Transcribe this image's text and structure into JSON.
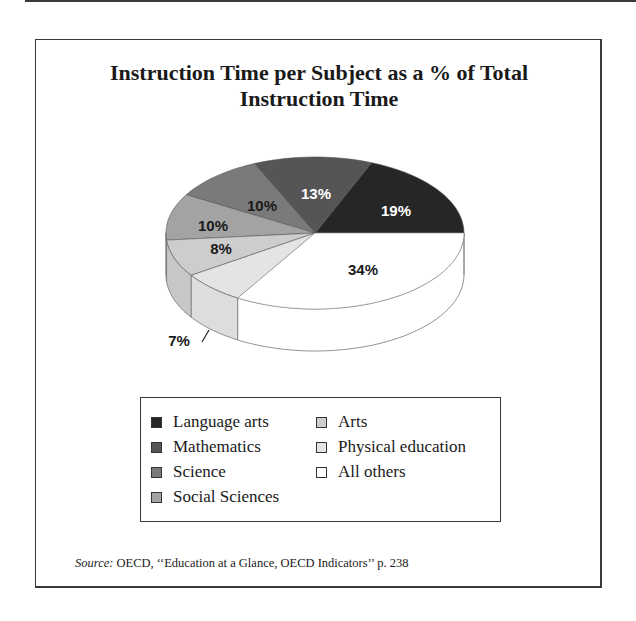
{
  "title": {
    "line1": "Instruction Time per Subject as a % of Total",
    "line2": "Instruction Time"
  },
  "chart_data": {
    "type": "pie",
    "style": "3d-pie",
    "title": "Instruction Time per Subject as a % of Total Instruction Time",
    "categories": [
      "Language arts",
      "Mathematics",
      "Science",
      "Social Sciences",
      "Arts",
      "Physical education",
      "All others"
    ],
    "values": [
      19,
      13,
      10,
      10,
      8,
      7,
      34
    ],
    "labels": [
      "19%",
      "13%",
      "10%",
      "10%",
      "8%",
      "7%",
      "34%"
    ],
    "colors": [
      "#262626",
      "#555555",
      "#7a7a7a",
      "#a3a3a3",
      "#cdcdcd",
      "#e4e4e4",
      "#ffffff"
    ],
    "legend_position": "bottom",
    "source": "OECD, ‘‘Education at a Glance, OECD Indicators’’ p. 238"
  },
  "slices": [
    {
      "name": "Language arts",
      "label": "19%",
      "color": "#262626",
      "text_color": "#ffffff"
    },
    {
      "name": "Mathematics",
      "label": "13%",
      "color": "#555555",
      "text_color": "#ffffff"
    },
    {
      "name": "Science",
      "label": "10%",
      "color": "#7a7a7a",
      "text_color": "#1a1a1a"
    },
    {
      "name": "Social Sciences",
      "label": "10%",
      "color": "#a3a3a3",
      "text_color": "#1a1a1a"
    },
    {
      "name": "Arts",
      "label": "8%",
      "color": "#cdcdcd",
      "text_color": "#1a1a1a"
    },
    {
      "name": "Physical education",
      "label": "7%",
      "color": "#e4e4e4",
      "text_color": "#1a1a1a"
    },
    {
      "name": "All others",
      "label": "34%",
      "color": "#ffffff",
      "text_color": "#1a1a1a"
    }
  ],
  "legend": {
    "items": [
      {
        "label": "Language arts",
        "color": "#262626"
      },
      {
        "label": "Mathematics",
        "color": "#555555"
      },
      {
        "label": "Science",
        "color": "#7a7a7a"
      },
      {
        "label": "Social Sciences",
        "color": "#a3a3a3"
      },
      {
        "label": "Arts",
        "color": "#cdcdcd"
      },
      {
        "label": "Physical education",
        "color": "#e4e4e4"
      },
      {
        "label": "All others",
        "color": "#ffffff"
      }
    ]
  },
  "source": {
    "prefix": "Source:",
    "text": " OECD, ‘‘Education at a Glance, OECD Indicators’’ p. 238"
  }
}
